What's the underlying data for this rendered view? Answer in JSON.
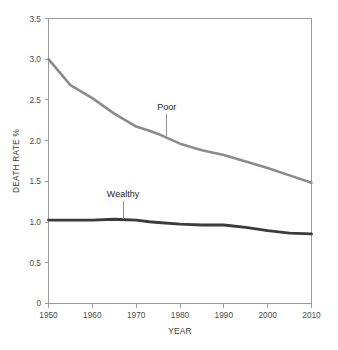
{
  "chart_data": {
    "type": "line",
    "title": "",
    "xlabel": "YEAR",
    "ylabel": "DEATH RATE %",
    "xlim": [
      1950,
      2010
    ],
    "ylim": [
      0,
      3.5
    ],
    "grid": false,
    "legend_position": "inline-annotations",
    "x_ticks": [
      "1950",
      "1960",
      "1970",
      "1980",
      "1990",
      "2000",
      "2010"
    ],
    "y_ticks": [
      "0",
      "0.5",
      "1.0",
      "1.5",
      "2.0",
      "2.5",
      "3.0",
      "3.5"
    ],
    "x": [
      1950,
      1955,
      1960,
      1965,
      1970,
      1973,
      1975,
      1980,
      1985,
      1990,
      1995,
      2000,
      2005,
      2010
    ],
    "series": [
      {
        "name": "Poor",
        "color": "#8b8b8b",
        "values": [
          3.0,
          2.68,
          2.52,
          2.33,
          2.17,
          2.12,
          2.08,
          1.96,
          1.88,
          1.82,
          1.74,
          1.66,
          1.57,
          1.48
        ]
      },
      {
        "name": "Wealthy",
        "color": "#3b3b3b",
        "values": [
          1.02,
          1.02,
          1.02,
          1.03,
          1.02,
          1.0,
          0.99,
          0.97,
          0.96,
          0.96,
          0.93,
          0.89,
          0.86,
          0.85
        ]
      }
    ],
    "annotations": [
      {
        "text": "Poor",
        "x": 1977,
        "y": 2.38,
        "leader_to_y": 2.05
      },
      {
        "text": "Wealthy",
        "x": 1967,
        "y": 1.3,
        "leader_to_y": 1.03
      }
    ]
  },
  "axes": {
    "y_label": "DEATH RATE %",
    "x_label": "YEAR",
    "y_tick_labels": [
      "3.5",
      "3.0",
      "2.5",
      "2.0",
      "1.5",
      "1.0",
      "0.5",
      "0"
    ],
    "x_tick_labels": [
      "1950",
      "1960",
      "1970",
      "1980",
      "1990",
      "2000",
      "2010"
    ]
  },
  "labels": {
    "poor": "Poor",
    "wealthy": "Wealthy"
  },
  "colors": {
    "poor_line": "#8b8b8b",
    "wealthy_line": "#3b3b3b",
    "axis": "#9b9b9b",
    "text": "#3d3d3d",
    "background": "#ffffff"
  }
}
